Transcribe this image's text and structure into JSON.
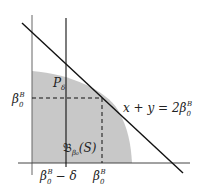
{
  "diagram": {
    "colors": {
      "shade": "#c8c8c8",
      "axis": "#555555",
      "line": "#111111",
      "dashed": "#111111",
      "text": "#222222"
    },
    "labels": {
      "y_tick": {
        "base": "β",
        "sub": "0",
        "sup": "B"
      },
      "x_tick_left": {
        "base": "β",
        "sub": "0",
        "sup": "B",
        "suffix": "− δ"
      },
      "x_tick_right": {
        "base": "β",
        "sub": "0",
        "sup": "B"
      },
      "line_eq": {
        "text": "x + y = 2β",
        "sub": "0",
        "sup": "B"
      },
      "point": {
        "base": "P",
        "sub": "δ"
      },
      "region": {
        "base": "𝔅",
        "sub": "β₀",
        "suffix": "(S)"
      }
    }
  }
}
